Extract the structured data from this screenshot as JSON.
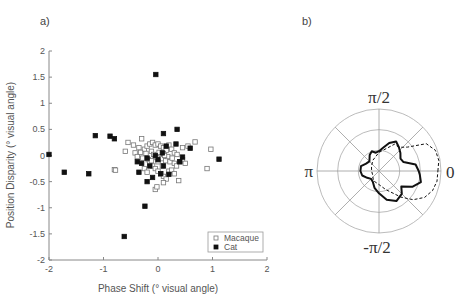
{
  "panels": {
    "a_label": "a)",
    "b_label": "b)"
  },
  "chart_data": [
    {
      "type": "scatter",
      "title": "",
      "panel": "a)",
      "xlabel": "Phase Shift (° visual angle)",
      "ylabel": "Position Disparity (° visual angle)",
      "xlim": [
        -2,
        2
      ],
      "ylim": [
        -2,
        2
      ],
      "xticks": [
        "-2",
        "-1",
        "0",
        "1",
        "2"
      ],
      "yticks": [
        "2",
        "1.5",
        "1",
        "0.5",
        "0",
        "-0.5",
        "-1",
        "-1.5",
        "-2"
      ],
      "grid": false,
      "legend_position": "lower right",
      "legend": [
        {
          "name": "Macaque",
          "marker": "open-square"
        },
        {
          "name": "Cat",
          "marker": "filled-square"
        }
      ],
      "series": [
        {
          "name": "Macaque",
          "points": [
            [
              -0.55,
              0.25
            ],
            [
              -0.45,
              0.2
            ],
            [
              -0.35,
              0.15
            ],
            [
              -0.3,
              0.32
            ],
            [
              -0.25,
              0.12
            ],
            [
              -0.2,
              0.18
            ],
            [
              -0.15,
              0.22
            ],
            [
              -0.1,
              0.25
            ],
            [
              -0.05,
              0.2
            ],
            [
              0.0,
              0.22
            ],
            [
              0.05,
              0.18
            ],
            [
              0.1,
              0.15
            ],
            [
              0.15,
              0.1
            ],
            [
              0.2,
              0.2
            ],
            [
              0.25,
              0.12
            ],
            [
              0.3,
              0.05
            ],
            [
              0.35,
              0.02
            ],
            [
              0.45,
              0.15
            ],
            [
              0.55,
              0.18
            ],
            [
              0.68,
              0.26
            ],
            [
              0.97,
              0.12
            ],
            [
              0.9,
              -0.25
            ],
            [
              -0.6,
              0.08
            ],
            [
              -0.42,
              0.05
            ],
            [
              -0.38,
              -0.02
            ],
            [
              -0.32,
              0.06
            ],
            [
              -0.28,
              -0.05
            ],
            [
              -0.22,
              0.04
            ],
            [
              -0.18,
              -0.08
            ],
            [
              -0.12,
              0.08
            ],
            [
              -0.08,
              0.02
            ],
            [
              -0.02,
              -0.04
            ],
            [
              0.02,
              0.06
            ],
            [
              0.06,
              -0.06
            ],
            [
              0.1,
              0.04
            ],
            [
              0.14,
              -0.1
            ],
            [
              0.18,
              -0.02
            ],
            [
              0.22,
              -0.12
            ],
            [
              0.26,
              -0.05
            ],
            [
              0.3,
              -0.15
            ],
            [
              0.34,
              -0.2
            ],
            [
              0.4,
              -0.12
            ],
            [
              0.45,
              -0.08
            ],
            [
              0.5,
              -0.15
            ],
            [
              -0.15,
              -0.15
            ],
            [
              -0.1,
              -0.2
            ],
            [
              -0.05,
              -0.25
            ],
            [
              0.0,
              -0.3
            ],
            [
              0.05,
              -0.35
            ],
            [
              0.1,
              -0.4
            ],
            [
              0.15,
              -0.45
            ],
            [
              0.2,
              -0.3
            ],
            [
              0.25,
              -0.28
            ],
            [
              0.3,
              -0.35
            ],
            [
              0.38,
              -0.48
            ],
            [
              -0.05,
              -0.65
            ],
            [
              -0.02,
              -0.6
            ],
            [
              0.1,
              -0.52
            ],
            [
              -0.8,
              -0.27
            ],
            [
              -0.78,
              -0.28
            ],
            [
              -0.25,
              -0.25
            ],
            [
              -0.2,
              -0.32
            ],
            [
              0.08,
              -0.2
            ],
            [
              -0.12,
              -0.1
            ],
            [
              0.12,
              0.0
            ],
            [
              0.0,
              -0.12
            ]
          ]
        },
        {
          "name": "Cat",
          "points": [
            [
              -0.04,
              1.55
            ],
            [
              -1.15,
              0.38
            ],
            [
              -0.88,
              0.37
            ],
            [
              -0.8,
              0.32
            ],
            [
              0.1,
              0.42
            ],
            [
              0.35,
              0.5
            ],
            [
              -2.0,
              0.02
            ],
            [
              -1.72,
              -0.32
            ],
            [
              -1.27,
              -0.35
            ],
            [
              -0.62,
              -1.55
            ],
            [
              -0.24,
              -0.97
            ],
            [
              0.59,
              0.14
            ],
            [
              1.12,
              -0.07
            ],
            [
              0.33,
              0.22
            ],
            [
              0.15,
              0.18
            ],
            [
              -0.38,
              -0.12
            ],
            [
              -0.35,
              -0.32
            ],
            [
              -0.2,
              -0.5
            ],
            [
              -0.1,
              -0.42
            ],
            [
              0.05,
              -0.35
            ],
            [
              0.2,
              -0.36
            ],
            [
              0.4,
              -0.12
            ],
            [
              0.45,
              -0.03
            ],
            [
              -0.2,
              -0.05
            ],
            [
              -0.05,
              0.0
            ],
            [
              0.0,
              -0.08
            ],
            [
              -0.15,
              -0.2
            ],
            [
              0.1,
              -0.2
            ],
            [
              -0.3,
              -0.15
            ],
            [
              0.08,
              0.05
            ]
          ]
        }
      ]
    },
    {
      "type": "polar",
      "panel": "b)",
      "title": "",
      "angle_labels": {
        "right": "0",
        "top": "π/2",
        "left": "π",
        "bottom": "-π/2"
      },
      "rings": 3,
      "spokes_deg": [
        0,
        45,
        90,
        135,
        180,
        225,
        270,
        315
      ],
      "grid": true,
      "series": [
        {
          "name": "solid",
          "style": "solid-thick",
          "radius_by_angle_deg": [
            [
              0,
              0.64
            ],
            [
              10,
              0.6
            ],
            [
              20,
              0.42
            ],
            [
              30,
              0.4
            ],
            [
              40,
              0.45
            ],
            [
              50,
              0.5
            ],
            [
              60,
              0.55
            ],
            [
              70,
              0.48
            ],
            [
              80,
              0.38
            ],
            [
              90,
              0.32
            ],
            [
              100,
              0.3
            ],
            [
              110,
              0.34
            ],
            [
              120,
              0.3
            ],
            [
              135,
              0.22
            ],
            [
              150,
              0.24
            ],
            [
              165,
              0.3
            ],
            [
              180,
              0.3
            ],
            [
              195,
              0.28
            ],
            [
              210,
              0.22
            ],
            [
              225,
              0.18
            ],
            [
              240,
              0.2
            ],
            [
              255,
              0.28
            ],
            [
              270,
              0.36
            ],
            [
              285,
              0.48
            ],
            [
              300,
              0.56
            ],
            [
              315,
              0.52
            ],
            [
              325,
              0.44
            ],
            [
              335,
              0.6
            ],
            [
              345,
              0.7
            ],
            [
              355,
              0.66
            ]
          ]
        },
        {
          "name": "dashed",
          "style": "dashed",
          "radius_by_angle_deg": [
            [
              0,
              0.95
            ],
            [
              10,
              0.98
            ],
            [
              20,
              0.97
            ],
            [
              30,
              0.88
            ],
            [
              40,
              0.6
            ],
            [
              50,
              0.5
            ],
            [
              60,
              0.5
            ],
            [
              90,
              0.3
            ],
            [
              120,
              0.2
            ],
            [
              150,
              0.14
            ],
            [
              180,
              0.12
            ],
            [
              210,
              0.12
            ],
            [
              240,
              0.18
            ],
            [
              270,
              0.22
            ],
            [
              290,
              0.32
            ],
            [
              310,
              0.55
            ],
            [
              320,
              0.72
            ],
            [
              330,
              0.85
            ],
            [
              340,
              0.92
            ],
            [
              350,
              0.95
            ]
          ]
        }
      ]
    }
  ]
}
